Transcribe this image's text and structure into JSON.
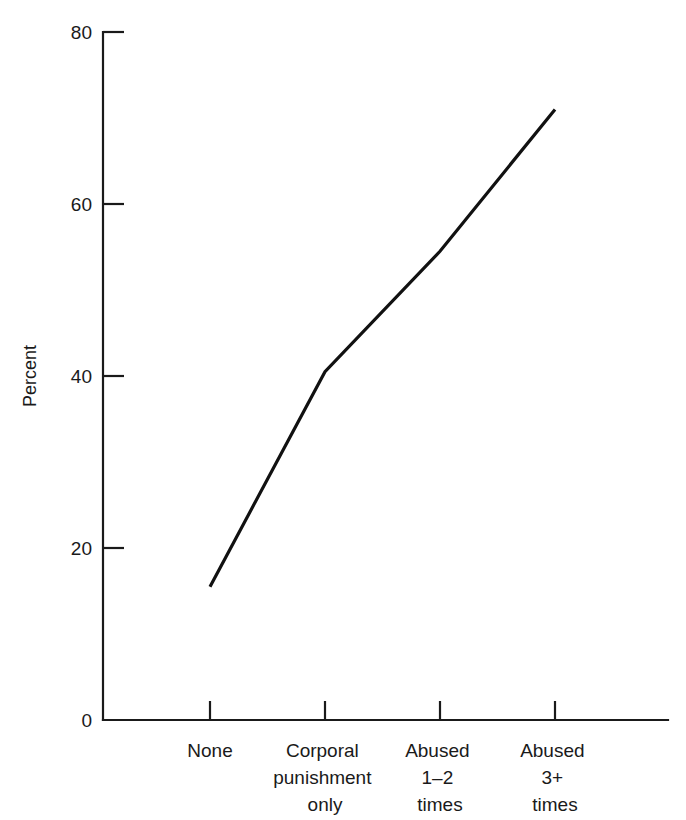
{
  "chart_data": {
    "type": "line",
    "title": "",
    "subtitle": "",
    "xlabel": "",
    "ylabel": "Percent",
    "categories": [
      "None",
      "Corporal punishment only",
      "Abused 1–2 times",
      "Abused 3+ times"
    ],
    "category_lines": [
      [
        "None"
      ],
      [
        "Corporal",
        "punishment",
        "only"
      ],
      [
        "Abused",
        "1–2",
        "times"
      ],
      [
        "Abused",
        "3+",
        "times"
      ]
    ],
    "values": [
      15.5,
      40.5,
      54.5,
      71
    ],
    "x": [
      1,
      2,
      3,
      4
    ],
    "ylim": [
      0,
      80
    ],
    "yticks": [
      0,
      20,
      40,
      60,
      80
    ],
    "ytick_labels": [
      "0",
      "20",
      "40",
      "60",
      "80"
    ],
    "xtick_positions": [
      1,
      2,
      3,
      4
    ],
    "grid": false,
    "legend": null,
    "legend_position": "none",
    "series": [
      {
        "name": "Percent",
        "values": [
          15.5,
          40.5,
          54.5,
          71
        ],
        "color": "#111111"
      }
    ],
    "line_color": "#111111",
    "axis_color": "#1a1a1a",
    "background_color": "#ffffff",
    "tick_direction": "in",
    "markers": false
  },
  "axes": {
    "y_axis_name": "y-axis",
    "x_axis_name": "x-axis"
  },
  "artifact": {
    "top_bleed_text": ""
  }
}
